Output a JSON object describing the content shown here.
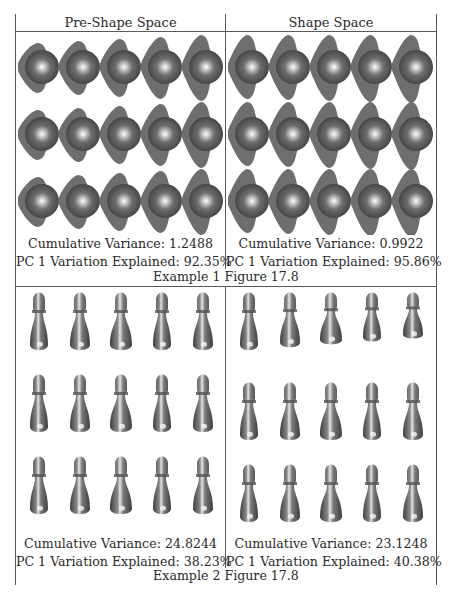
{
  "table": {
    "headers": [
      "Pre-Shape Space",
      "Shape Space"
    ]
  },
  "examples": [
    {
      "figure_caption": "Example 1 Figure 17.8",
      "shape_type": "blob-with-two-lobes",
      "grid": {
        "rows": 3,
        "cols": 5
      },
      "panels": [
        {
          "space": "Pre-Shape Space",
          "cumulative_variance_label": "Cumulative Variance: 1.2488",
          "pc1_label": "PC 1 Variation Explained: 92.35%"
        },
        {
          "space": "Shape Space",
          "cumulative_variance_label": "Cumulative Variance: 0.9922",
          "pc1_label": "PC 1 Variation Explained: 95.86%"
        }
      ]
    },
    {
      "figure_caption": "Example 2 Figure 17.8",
      "shape_type": "chess-pawn",
      "grid": {
        "rows": 3,
        "cols": 5
      },
      "panels": [
        {
          "space": "Pre-Shape Space",
          "cumulative_variance_label": "Cumulative Variance: 24.8244",
          "pc1_label": "PC 1 Variation Explained: 38.23%"
        },
        {
          "space": "Shape Space",
          "cumulative_variance_label": "Cumulative Variance: 23.1248",
          "pc1_label": "PC 1 Variation Explained: 40.38%"
        }
      ]
    }
  ],
  "colors": {
    "shape_base": "#6e6e6e",
    "shape_dark": "#3f3f3f",
    "shape_highlight": "#ffffff",
    "border": "#5a5a5a",
    "text": "#2a2a2a"
  }
}
